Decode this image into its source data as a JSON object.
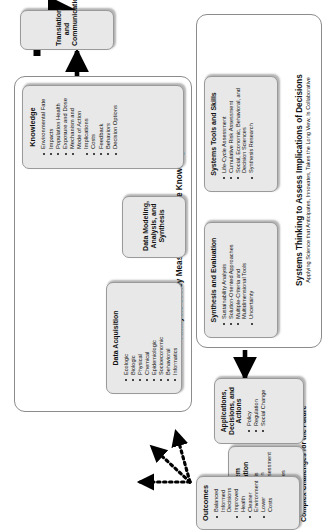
{
  "diagram": {
    "header_label": "Complex Challenges for the Future",
    "groups": [
      {
        "id": "analysis-group",
        "title": "Analysis of Key Measures to Advance Knowledge",
        "subtitle": ""
      },
      {
        "id": "systems-group",
        "title": "Systems Thinking to Assess Implications of Decisions",
        "subtitle": "Applying Science that Anticipates, Innovates, Takes the Long View, Is Collaborative"
      }
    ],
    "boxes": {
      "problem_formulation": {
        "title": "Problem Formulation",
        "items": [
          "Hypothesis Generation",
          "Needs Assessment",
          "Technical Approaches"
        ]
      },
      "data_acquisition": {
        "title": "Data Acquisition",
        "items": [
          "Ecologic",
          "Biologic",
          "Physical",
          "Chemical",
          "Epidemiologic",
          "Socioeconomic",
          "Behavioral",
          "Informatics"
        ]
      },
      "data_modeling": {
        "title": "Data Modeling, Analysis, and Synthesis",
        "items": []
      },
      "knowledge": {
        "title": "Knowledge",
        "items": [
          "Environmental Fate",
          "Impacts",
          "Population Health",
          "Exposure and Dose",
          "Mechanism and Mode of Action",
          "Implications",
          "Costs",
          "Feedback",
          "Behaviors",
          "Decision Options"
        ]
      },
      "translation": {
        "title": "Translation and Communication",
        "items": []
      },
      "systems_tools": {
        "title": "Systems Tools and Skills",
        "items": [
          "Life-Cycle Assessment",
          "Cumulative Risk Assessment",
          "Social, Economic, Behavioral, and Decision Sciences",
          "Synthesis Research"
        ]
      },
      "synthesis_evaluation": {
        "title": "Synthesis and Evaluation",
        "items": [
          "Sustainability Analysis",
          "Solution-Oriented Approaches",
          "Multiple-Criteria and Multidimensional Tools",
          "Uncertainty"
        ]
      },
      "applications": {
        "title": "Applications, Decisions, and Actions",
        "items": [
          "Policy",
          "Regulation",
          "Social Change"
        ]
      },
      "outcomes": {
        "title": "Outcomes",
        "items": [
          "Balanced Informed Decisions",
          "Improved Health",
          "Cleaner Environment",
          "Lower Costs"
        ]
      }
    },
    "colors": {
      "box_fill": "#e8e8e8",
      "box_border": "#9a9a9a",
      "group_border": "#8c8c8c",
      "arrow": "#000000",
      "text": "#111111",
      "background": "#ffffff"
    }
  }
}
